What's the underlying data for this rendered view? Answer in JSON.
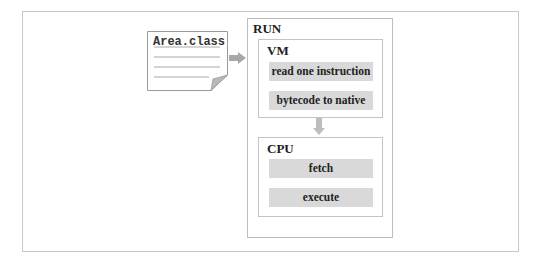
{
  "diagram": {
    "file": {
      "name": "Area.class",
      "line_count": 4
    },
    "run": {
      "label": "RUN",
      "vm": {
        "label": "VM",
        "steps": [
          "read one instruction",
          "bytecode to native"
        ]
      },
      "cpu": {
        "label": "CPU",
        "steps": [
          "fetch",
          "execute"
        ]
      }
    },
    "arrows": [
      {
        "from": "Area.class",
        "to": "RUN",
        "icon": "arrow-right-icon"
      },
      {
        "from": "VM",
        "to": "CPU",
        "icon": "arrow-down-icon"
      }
    ],
    "colors": {
      "step_fill": "#d9d9d9",
      "border": "#c4c4c4",
      "arrow": "#a8a8a8"
    }
  }
}
